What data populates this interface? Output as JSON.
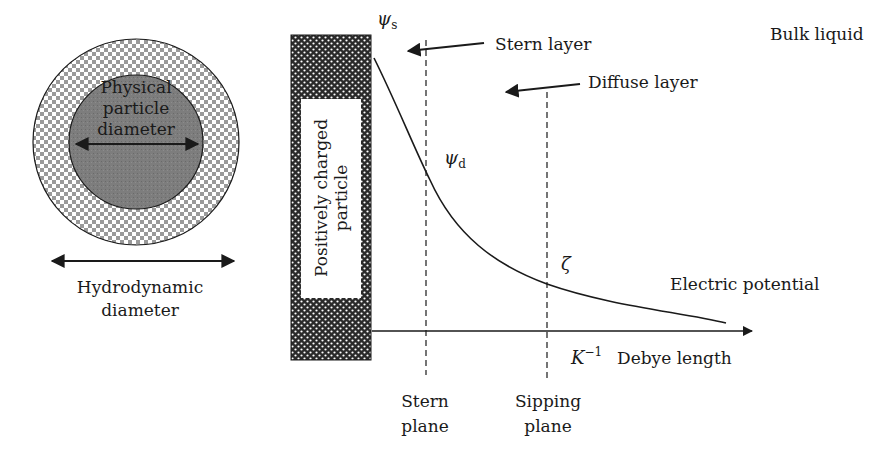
{
  "left_panel": {
    "inner_label_lines": [
      "Physical",
      "particle",
      "diameter"
    ],
    "outer_label_lines": [
      "Hydrodynamic",
      "diameter"
    ]
  },
  "right_panel": {
    "particle_label_lines": [
      "Positively charged",
      "particle"
    ],
    "psi_s_symbol": "ψ",
    "psi_s_sub": "s",
    "psi_d_symbol": "ψ",
    "psi_d_sub": "d",
    "zeta_symbol": "ζ",
    "stern_layer": "Stern layer",
    "diffuse_layer": "Diffuse layer",
    "bulk_liquid": "Bulk liquid",
    "electric_potential": "Electric potential",
    "debye_symbol": "K",
    "debye_sup": "−1",
    "debye_length": "Debye length",
    "stern_plane_lines": [
      "Stern",
      "plane"
    ],
    "slipping_plane_lines": [
      "Sipping",
      "plane"
    ]
  },
  "colors": {
    "ink": "#1a1a1a",
    "inner_particle": "#7d7d7d",
    "checker": "#9a9a9a"
  }
}
